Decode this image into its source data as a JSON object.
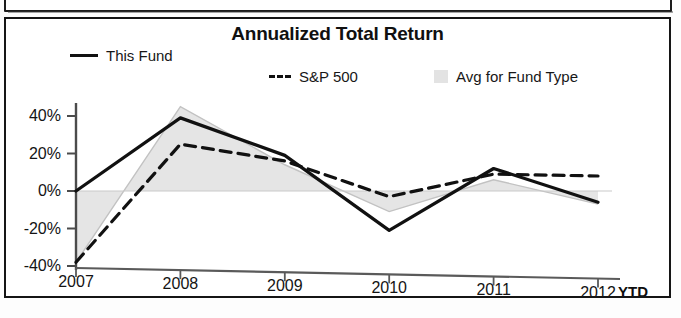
{
  "panel": {
    "title": "Annualized Total Return"
  },
  "legend": [
    {
      "label": "This Fund",
      "marker": "solid-line-swatch",
      "color": "#111111"
    },
    {
      "label": "S&P 500",
      "marker": "dashed-line-swatch",
      "color": "#111111"
    },
    {
      "label": "Avg for Fund Type",
      "marker": "area-swatch",
      "color": "#dcdcdc"
    }
  ],
  "axis": {
    "y_ticks": [
      "40%",
      "20%",
      "0%",
      "-20%",
      "-40%"
    ],
    "x_ticks": [
      "2007",
      "2008",
      "2009",
      "2010",
      "2011",
      "2012"
    ],
    "x_suffix": "YTD"
  },
  "chart_data": {
    "type": "line",
    "title": "Annualized Total Return",
    "xlabel": "",
    "ylabel": "",
    "categories": [
      "2007",
      "2008",
      "2009",
      "2010",
      "2011",
      "2012"
    ],
    "x_note": "2012 is YTD",
    "ylim": [
      -40,
      50
    ],
    "y_ticks": [
      -40,
      -20,
      0,
      20,
      40
    ],
    "y_unit": "percent",
    "grid": false,
    "legend_position": "top",
    "series": [
      {
        "name": "This Fund",
        "style": "solid",
        "color": "#111111",
        "values": [
          0,
          39,
          19,
          -21,
          12,
          -6
        ]
      },
      {
        "name": "S&P 500",
        "style": "dashed",
        "color": "#111111",
        "values": [
          -38,
          25,
          16,
          -3,
          9,
          8
        ]
      },
      {
        "name": "Avg for Fund Type",
        "style": "filled-area",
        "color": "#dcdcdc",
        "values": [
          -38,
          45,
          14,
          -11,
          6,
          -7
        ]
      }
    ],
    "zero_line": 0
  }
}
